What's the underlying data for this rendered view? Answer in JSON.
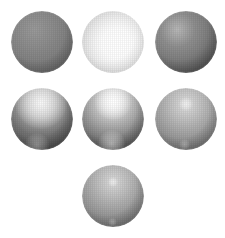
{
  "figure": {
    "background_color": "#ffffff",
    "width": 225,
    "height": 238,
    "layout": "pyramid-3-3-1",
    "row_counts": [
      3,
      3,
      1
    ]
  },
  "chart_data": {
    "type": "table",
    "xlabel": "",
    "ylabel": "",
    "categories": [
      "sphere-1",
      "sphere-2",
      "sphere-3",
      "sphere-4",
      "sphere-5",
      "sphere-6",
      "sphere-7"
    ],
    "values": [
      0,
      100,
      12,
      38,
      72,
      22,
      18
    ],
    "series": [
      {
        "name": "highlight_brightness_percent",
        "values": [
          0,
          100,
          12,
          38,
          72,
          22,
          18
        ]
      },
      {
        "name": "highlight_radius_px",
        "values": [
          0,
          30,
          26,
          13,
          10,
          4,
          3
        ]
      },
      {
        "name": "base_gray_level",
        "values": [
          105,
          250,
          120,
          118,
          122,
          124,
          120
        ]
      }
    ],
    "legend_position": "none",
    "grid": false
  },
  "spheres": [
    {
      "id": "sphere-1",
      "label": "top-left",
      "row": 1,
      "column": 1,
      "center_x": 42,
      "center_y": 42,
      "radius": 31,
      "base_color": "#6e6e6e",
      "shadow_color": "#3c3c3c",
      "highlight_color": "#9a9a9a",
      "highlight_x_pct": 38,
      "highlight_y_pct": 30,
      "highlight_radius_pct": 0,
      "highlight_opacity": 0.0,
      "secondary_highlight": false,
      "description": "matte diffuse sphere, no visible specular highlight"
    },
    {
      "id": "sphere-2",
      "label": "top-center",
      "row": 1,
      "column": 2,
      "center_x": 113,
      "center_y": 42,
      "radius": 31,
      "base_color": "#fafafa",
      "shadow_color": "#8f8f8f",
      "highlight_color": "#ffffff",
      "highlight_x_pct": 56,
      "highlight_y_pct": 52,
      "highlight_radius_pct": 96,
      "highlight_opacity": 1.0,
      "secondary_highlight": false,
      "description": "saturated bright sphere with dark crescent along left limb"
    },
    {
      "id": "sphere-3",
      "label": "top-right",
      "row": 1,
      "column": 3,
      "center_x": 186,
      "center_y": 42,
      "radius": 31,
      "base_color": "#787878",
      "shadow_color": "#454545",
      "highlight_color": "#a8a8a8",
      "highlight_x_pct": 36,
      "highlight_y_pct": 30,
      "highlight_radius_pct": 84,
      "highlight_opacity": 0.28,
      "secondary_highlight": false,
      "description": "broad soft gradient, brighter toward upper-left"
    },
    {
      "id": "sphere-4",
      "label": "middle-left",
      "row": 2,
      "column": 1,
      "center_x": 42,
      "center_y": 119,
      "radius": 31,
      "base_color": "#757575",
      "shadow_color": "#3f3f3f",
      "highlight_color": "#e8e8e8",
      "highlight_x_pct": 48,
      "highlight_y_pct": 24,
      "highlight_radius_pct": 42,
      "highlight_opacity": 0.78,
      "secondary_highlight": true,
      "secondary_x_pct": 42,
      "secondary_y_pct": 92,
      "secondary_radius_pct": 20,
      "secondary_opacity": 0.34,
      "description": "wide rough specular lobe near upper-center plus faint bottom glow"
    },
    {
      "id": "sphere-5",
      "label": "middle-center",
      "row": 2,
      "column": 2,
      "center_x": 113,
      "center_y": 119,
      "radius": 31,
      "base_color": "#7a7a7a",
      "shadow_color": "#434343",
      "highlight_color": "#ffffff",
      "highlight_x_pct": 50,
      "highlight_y_pct": 22,
      "highlight_radius_pct": 30,
      "highlight_opacity": 0.96,
      "secondary_highlight": true,
      "secondary_x_pct": 48,
      "secondary_y_pct": 90,
      "secondary_radius_pct": 22,
      "secondary_opacity": 0.5,
      "description": "bright concentrated specular highlight plus secondary bottom glow"
    },
    {
      "id": "sphere-6",
      "label": "middle-right",
      "row": 2,
      "column": 3,
      "center_x": 186,
      "center_y": 119,
      "radius": 31,
      "base_color": "#7c7c7c",
      "shadow_color": "#4a4a4a",
      "highlight_color": "#e0e0e0",
      "highlight_x_pct": 50,
      "highlight_y_pct": 26,
      "highlight_radius_pct": 11,
      "highlight_opacity": 0.62,
      "secondary_highlight": true,
      "secondary_x_pct": 48,
      "secondary_y_pct": 91,
      "secondary_radius_pct": 9,
      "secondary_opacity": 0.3,
      "description": "tight small specular highlight with faint spot near bottom edge"
    },
    {
      "id": "sphere-7",
      "label": "bottom-center",
      "row": 3,
      "column": 2,
      "center_x": 113,
      "center_y": 196,
      "radius": 31,
      "base_color": "#787878",
      "shadow_color": "#464646",
      "highlight_color": "#dcdcdc",
      "highlight_x_pct": 50,
      "highlight_y_pct": 27,
      "highlight_radius_pct": 8,
      "highlight_opacity": 0.6,
      "secondary_highlight": true,
      "secondary_x_pct": 49,
      "secondary_y_pct": 92,
      "secondary_radius_pct": 7,
      "secondary_opacity": 0.3,
      "description": "pinpoint sharp specular highlight with small bottom spot"
    }
  ]
}
